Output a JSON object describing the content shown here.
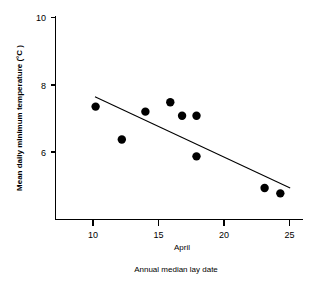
{
  "chart_data": {
    "type": "scatter",
    "title": "",
    "xlabel": "Annual median lay date",
    "xsublabel": "April",
    "ylabel": "Mean daily minimum temperature (°C )",
    "xlim": [
      7.6,
      27.2
    ],
    "ylim": [
      4.2,
      10.0
    ],
    "xticks": [
      10,
      15,
      20,
      25
    ],
    "xticklabels": [
      "10",
      "15",
      "20",
      "25"
    ],
    "yticks": [
      6,
      8,
      10
    ],
    "yticklabels": [
      "6",
      "8",
      "10"
    ],
    "grid": false,
    "legend": null,
    "points": [
      {
        "x": 10.2,
        "y": 7.35
      },
      {
        "x": 12.2,
        "y": 6.37
      },
      {
        "x": 14.0,
        "y": 7.2
      },
      {
        "x": 15.9,
        "y": 7.48
      },
      {
        "x": 16.8,
        "y": 7.08
      },
      {
        "x": 17.9,
        "y": 7.08
      },
      {
        "x": 17.9,
        "y": 5.87
      },
      {
        "x": 23.1,
        "y": 4.93
      },
      {
        "x": 24.3,
        "y": 4.77
      }
    ],
    "series": [
      {
        "name": "Mean daily minimum temperature",
        "x": [
          10.2,
          12.2,
          14.0,
          15.9,
          16.8,
          17.9,
          17.9,
          23.1,
          24.3
        ],
        "values": [
          7.35,
          6.37,
          7.2,
          7.48,
          7.08,
          7.08,
          5.87,
          4.93,
          4.77
        ]
      }
    ],
    "trendline": {
      "name": "linear regression fit",
      "x_start": 10.15,
      "y_start": 7.64,
      "x_end": 25.05,
      "y_end": 4.93
    },
    "marker": {
      "shape": "filled-circle",
      "radius_px": 4.2,
      "color": "#000000"
    },
    "colors": {
      "background": "#ffffff",
      "axis": "#000000",
      "point": "#000000",
      "line": "#000000"
    }
  }
}
